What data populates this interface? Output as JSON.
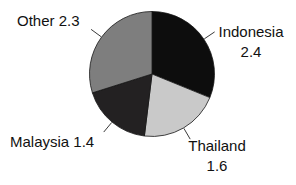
{
  "canvas": {
    "background": "#ffffff",
    "text_color": "#111111"
  },
  "chart_data": {
    "type": "pie",
    "title": "",
    "legend": "none",
    "label_style": "outside-with-leader-lines",
    "start_angle_deg": 0,
    "direction": "clockwise",
    "total": 7.7,
    "slices": [
      {
        "label": "Indonesia",
        "value": 2.4,
        "color": "#0d0d0d",
        "display": "Indonesia\n2.4"
      },
      {
        "label": "Thailand",
        "value": 1.6,
        "color": "#c9c9c9",
        "display": "Thailand\n1.6"
      },
      {
        "label": "Malaysia",
        "value": 1.4,
        "color": "#232122",
        "display": "Malaysia 1.4"
      },
      {
        "label": "Other",
        "value": 2.3,
        "color": "#7e7e7e",
        "display": "Other 2.3"
      }
    ],
    "leader_line_color": "#3a3a3a",
    "slice_outline_color": "#161616"
  }
}
